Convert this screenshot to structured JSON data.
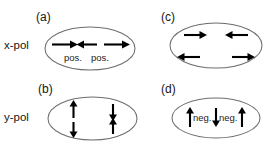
{
  "figure": {
    "title": "",
    "background_color": "#ffffff",
    "outline_color": "#6d6d6d",
    "arrow_color": "#000000",
    "text_color": "#161616",
    "width": 271,
    "height": 149
  },
  "row_labels": [
    {
      "id": "x-pol",
      "text": "x-pol"
    },
    {
      "id": "y-pol",
      "text": "y-pol"
    }
  ],
  "panels": [
    {
      "id": "a",
      "label": "(a)",
      "row": "x-pol",
      "polarization": "x",
      "charge_labels": [
        "pos.",
        "pos."
      ],
      "arrows": [
        {
          "name": "arrow-left-right",
          "direction": "right"
        },
        {
          "name": "arrow-center-left",
          "direction": "left"
        },
        {
          "name": "arrow-right-right",
          "direction": "right"
        }
      ]
    },
    {
      "id": "b",
      "label": "(b)",
      "row": "y-pol",
      "polarization": "y",
      "charge_labels": [],
      "arrows": [
        {
          "name": "arrow-top-left-up",
          "direction": "up"
        },
        {
          "name": "arrow-top-right-down",
          "direction": "down"
        },
        {
          "name": "arrow-bottom-left-down",
          "direction": "down"
        },
        {
          "name": "arrow-bottom-right-up",
          "direction": "up"
        }
      ]
    },
    {
      "id": "c",
      "label": "(c)",
      "row": "x-pol",
      "polarization": "x",
      "charge_labels": [],
      "arrows": [
        {
          "name": "arrow-top-left-right",
          "direction": "right"
        },
        {
          "name": "arrow-top-right-left",
          "direction": "left"
        },
        {
          "name": "arrow-bottom-left-left",
          "direction": "left"
        },
        {
          "name": "arrow-bottom-right-right",
          "direction": "right"
        }
      ]
    },
    {
      "id": "d",
      "label": "(d)",
      "row": "y-pol",
      "polarization": "y",
      "charge_labels": [
        "neg.",
        "neg."
      ],
      "arrows": [
        {
          "name": "arrow-left-up",
          "direction": "up"
        },
        {
          "name": "arrow-center-down",
          "direction": "down"
        },
        {
          "name": "arrow-right-up",
          "direction": "up"
        }
      ]
    }
  ]
}
